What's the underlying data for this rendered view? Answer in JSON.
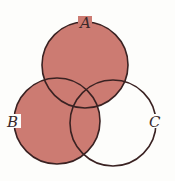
{
  "diagram": {
    "type": "venn",
    "shaded_region": "A ∪ B",
    "fill_color": "#cc7b72",
    "stroke_color": "#3a2222",
    "background_color": "#fdfdfb",
    "sets": [
      {
        "label": "A",
        "cx": 85,
        "cy": 65,
        "r": 43
      },
      {
        "label": "B",
        "cx": 57,
        "cy": 121,
        "r": 43
      },
      {
        "label": "C",
        "cx": 113,
        "cy": 123,
        "r": 43
      }
    ]
  }
}
